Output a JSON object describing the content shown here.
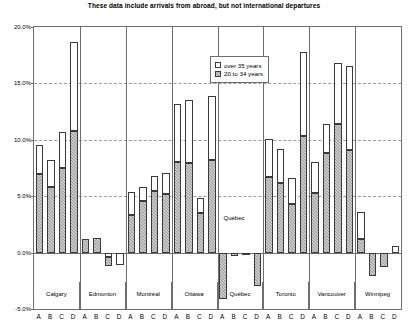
{
  "chart": {
    "title": "These data include arrivals from abroad, but not international departures",
    "legend": {
      "position": "top-center-inside",
      "items": [
        {
          "label": "over 35 years",
          "swatch": "white-square-outline"
        },
        {
          "label": "20 to 34 years",
          "swatch": "gray-hatched-square"
        }
      ]
    },
    "quebec_annotation": "Québec",
    "y_ticks": [
      "20.0%",
      "15.0%",
      "10.0%",
      "5.0%",
      "0.0%",
      "-5.0%"
    ]
  },
  "chart_data": {
    "type": "bar",
    "subtype": "stacked",
    "title": "These data include arrivals from abroad, but not international departures",
    "xlabel": "",
    "ylabel": "",
    "ylim": [
      -5.0,
      20.0
    ],
    "ytick_values": [
      20.0,
      15.0,
      10.0,
      5.0,
      0.0,
      -5.0
    ],
    "ytick_labels": [
      "20.0%",
      "15.0%",
      "10.0%",
      "5.0%",
      "0.0%",
      "-5.0%"
    ],
    "grid": true,
    "legend": [
      "over 35 years",
      "20 to 34 years"
    ],
    "groups": [
      "Calgary",
      "Edmonton",
      "Montréal",
      "Ottawa",
      "Québec",
      "Toronto",
      "Vancouver",
      "Winnipeg"
    ],
    "subcategories": [
      "A",
      "B",
      "C",
      "D"
    ],
    "categories": [
      "Calgary A",
      "Calgary B",
      "Calgary C",
      "Calgary D",
      "Edmonton A",
      "Edmonton B",
      "Edmonton C",
      "Edmonton D",
      "Montréal A",
      "Montréal B",
      "Montréal C",
      "Montréal D",
      "Ottawa A",
      "Ottawa B",
      "Ottawa C",
      "Ottawa D",
      "Québec A",
      "Québec B",
      "Québec C",
      "Québec D",
      "Toronto A",
      "Toronto B",
      "Toronto C",
      "Toronto D",
      "Vancouver A",
      "Vancouver B",
      "Vancouver C",
      "Vancouver D",
      "Winnipeg A",
      "Winnipeg B",
      "Winnipeg C",
      "Winnipeg D"
    ],
    "series": [
      {
        "name": "20 to 34 years",
        "values": [
          7.0,
          5.8,
          7.5,
          10.8,
          1.2,
          1.3,
          -0.8,
          0.0,
          3.3,
          4.6,
          5.5,
          5.2,
          8.0,
          7.9,
          3.5,
          8.2,
          -4.1,
          -2.6,
          -2.7,
          -3.6,
          6.7,
          6.2,
          4.3,
          10.3,
          5.3,
          8.8,
          11.4,
          9.1,
          1.2,
          -2.1,
          -1.3,
          0.0
        ]
      },
      {
        "name": "over 35 years",
        "values": [
          2.5,
          2.4,
          3.2,
          7.9,
          0.0,
          0.0,
          -0.4,
          -1.1,
          2.1,
          1.2,
          1.3,
          1.9,
          5.2,
          5.6,
          1.3,
          5.7,
          0.0,
          2.3,
          2.5,
          0.6,
          3.4,
          3.0,
          2.3,
          7.5,
          2.7,
          2.6,
          5.4,
          7.4,
          2.4,
          0.0,
          0.0,
          0.6
        ]
      }
    ],
    "totals": [
      9.5,
      8.2,
      10.7,
      18.7,
      1.2,
      1.3,
      -1.2,
      -1.1,
      5.4,
      5.8,
      6.8,
      7.1,
      13.2,
      13.5,
      4.8,
      13.9,
      -4.1,
      -0.3,
      -0.2,
      -3.0,
      10.1,
      9.2,
      6.6,
      17.8,
      8.0,
      11.4,
      16.8,
      16.5,
      3.6,
      -2.1,
      -1.3,
      0.6
    ]
  }
}
